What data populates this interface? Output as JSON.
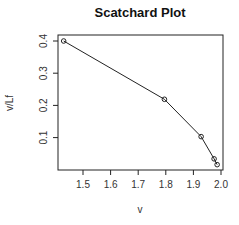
{
  "chart_data": {
    "type": "line",
    "title": "Scatchard Plot",
    "xlabel": "v",
    "ylabel": "v/Lf",
    "x": [
      1.43,
      1.795,
      1.928,
      1.975,
      1.986
    ],
    "y": [
      0.4,
      0.219,
      0.103,
      0.034,
      0.016
    ],
    "series": [
      {
        "name": "Scatchard",
        "x": [
          1.43,
          1.795,
          1.928,
          1.975,
          1.986
        ],
        "values": [
          0.4,
          0.219,
          0.103,
          0.034,
          0.016
        ],
        "marker": "open-circle",
        "line": true
      }
    ],
    "xticks": [
      "1.5",
      "1.6",
      "1.7",
      "1.8",
      "1.9",
      "2.0"
    ],
    "yticks": [
      "0.1",
      "0.2",
      "0.3",
      "0.4"
    ],
    "xlim": [
      1.41,
      2.01
    ],
    "ylim": [
      -0.01,
      0.42
    ],
    "grid": false,
    "legend": null
  },
  "colors": {
    "line": "#222222",
    "axis": "#222222",
    "background": "#ffffff"
  }
}
